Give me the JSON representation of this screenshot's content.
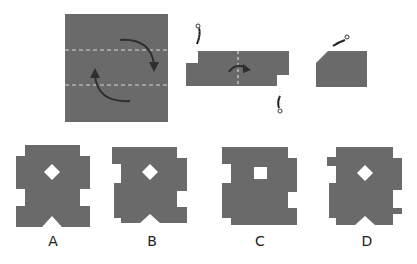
{
  "colors": {
    "paper": "#6a6a6a",
    "arrow": "#2e2e2e",
    "fold_line": "#d8d8d8",
    "hole": "#ffffff",
    "background": "#ffffff"
  },
  "steps": [
    {
      "name": "square-paper",
      "annotation": "fold top and bottom along dashed lines"
    },
    {
      "name": "folded-strip",
      "annotation": "cut corners, fold in half along dashed line"
    },
    {
      "name": "folded-piece",
      "annotation": "cut corner"
    }
  ],
  "options": [
    {
      "label": "A",
      "hole_shape": "diamond"
    },
    {
      "label": "B",
      "hole_shape": "diamond"
    },
    {
      "label": "C",
      "hole_shape": "square"
    },
    {
      "label": "D",
      "hole_shape": "diamond"
    }
  ]
}
